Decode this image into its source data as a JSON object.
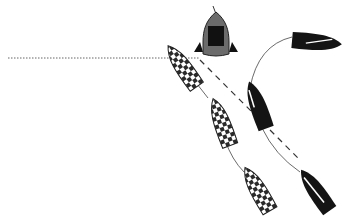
{
  "diagram": {
    "colors": {
      "background": "#ffffff",
      "committee_hull": "#6b6b6b",
      "committee_cabin": "#111111",
      "black_boat": "#141414",
      "checker_dark": "#2a2a2a",
      "checker_light": "#ffffff",
      "line": "#555555"
    },
    "start_line": {
      "x1": 8,
      "y1": 58,
      "x2": 200,
      "y2": 58,
      "style": "dotted"
    },
    "committee_boat": {
      "cx": 216,
      "cy": 34,
      "angle": 0
    },
    "checkered_boats": [
      {
        "id": "checkered-1",
        "cx": 183,
        "cy": 67,
        "angle": -35
      },
      {
        "id": "checkered-2",
        "cx": 222,
        "cy": 123,
        "angle": -20
      },
      {
        "id": "checkered-3",
        "cx": 258,
        "cy": 190,
        "angle": -30
      }
    ],
    "black_boats": [
      {
        "id": "black-1",
        "cx": 316,
        "cy": 42,
        "angle": 95
      },
      {
        "id": "black-2",
        "cx": 258,
        "cy": 106,
        "angle": -20
      },
      {
        "id": "black-3",
        "cx": 316,
        "cy": 191,
        "angle": -35
      }
    ]
  }
}
